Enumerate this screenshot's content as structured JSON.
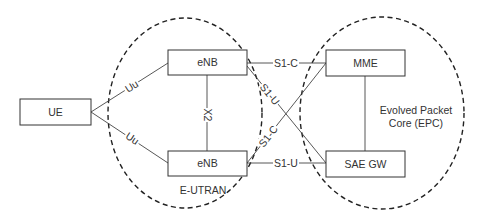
{
  "diagram": {
    "regions": {
      "eutran": {
        "label": "E-UTRAN"
      },
      "epc": {
        "label_line1": "Evolved Packet",
        "label_line2": "Core (EPC)"
      }
    },
    "nodes": {
      "ue": {
        "label": "UE"
      },
      "enb_top": {
        "label": "eNB"
      },
      "enb_bottom": {
        "label": "eNB"
      },
      "mme": {
        "label": "MME"
      },
      "sae_gw": {
        "label": "SAE GW"
      }
    },
    "links": {
      "uu_top": {
        "label": "Uu"
      },
      "uu_bottom": {
        "label": "Uu"
      },
      "x2": {
        "label": "X2"
      },
      "s1c_top": {
        "label": "S1-C"
      },
      "s1u_cross": {
        "label": "S1-U"
      },
      "s1c_cross": {
        "label": "S1-C"
      },
      "s1u_bottom": {
        "label": "S1-U"
      }
    }
  }
}
